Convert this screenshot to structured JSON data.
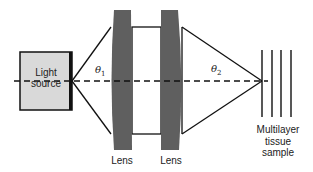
{
  "diagram": {
    "components": {
      "light_source": {
        "label_line1": "Light",
        "label_line2": "source",
        "fill": "#d9d9d9"
      },
      "lens_1": {
        "label": "Lens",
        "fill": "#5f5f5f"
      },
      "lens_2": {
        "label": "Lens",
        "fill": "#5f5f5f"
      },
      "sample": {
        "label_line1": "Multilayer",
        "label_line2": "tissue",
        "label_line3": "sample",
        "layer_count": 4
      }
    },
    "angles": {
      "theta1": {
        "symbol": "θ",
        "subscript": "1"
      },
      "theta2": {
        "symbol": "θ",
        "subscript": "2"
      }
    },
    "optical_axis": {
      "style": "dashed"
    }
  }
}
